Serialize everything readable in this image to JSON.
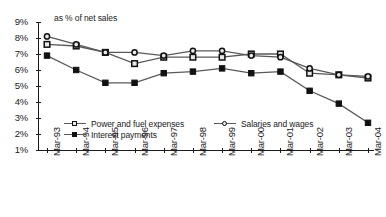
{
  "chart_data": {
    "type": "line",
    "title": "",
    "subtitle": "as % of net sales",
    "xlabel": "",
    "ylabel": "",
    "ylim": [
      1,
      9
    ],
    "ytick_labels": [
      "9%",
      "8%",
      "7%",
      "6%",
      "5%",
      "4%",
      "3%",
      "2%",
      "1%"
    ],
    "ytick_values": [
      9,
      8,
      7,
      6,
      5,
      4,
      3,
      2,
      1
    ],
    "grid": false,
    "legend_position": "bottom",
    "categories": [
      "Mar-93",
      "Mar-94",
      "Mar-95",
      "Mar-96",
      "Mar-97",
      "Mar-98",
      "Mar-99",
      "Mar-00",
      "Mar-01",
      "Mar-02",
      "Mar-03",
      "Mar-04"
    ],
    "series": [
      {
        "name": "Power and fuel expenses",
        "marker": "open-square",
        "color": "#595959",
        "values": [
          7.6,
          7.5,
          7.1,
          6.4,
          6.8,
          6.8,
          6.8,
          7.0,
          7.0,
          5.8,
          5.7,
          5.5
        ]
      },
      {
        "name": "Salaries and wages",
        "marker": "open-circle",
        "color": "#595959",
        "values": [
          8.1,
          7.6,
          7.1,
          7.1,
          6.9,
          7.2,
          7.2,
          6.9,
          6.8,
          6.1,
          5.7,
          5.6
        ]
      },
      {
        "name": "Interest payments",
        "marker": "filled-square",
        "color": "#595959",
        "values": [
          6.9,
          6.0,
          5.2,
          5.2,
          5.8,
          5.9,
          6.1,
          5.8,
          5.9,
          4.7,
          3.9,
          2.7
        ]
      }
    ]
  },
  "legend": {
    "entries": [
      {
        "label": "Power and fuel expenses",
        "marker": "open-square"
      },
      {
        "label": "Salaries and wages",
        "marker": "open-circle"
      },
      {
        "label": "Interest payments",
        "marker": "filled-square"
      }
    ]
  }
}
